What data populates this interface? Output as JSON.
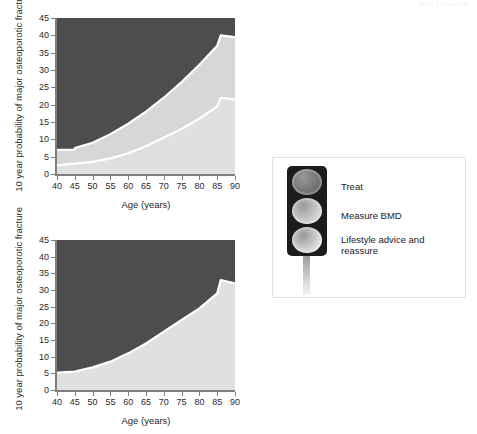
{
  "header": {
    "watermark": "BMJ | Practice"
  },
  "legend": {
    "panel_name": "traffic-light-legend",
    "items": [
      {
        "label": "Treat",
        "color": "#6b6b6b",
        "lamp": "red-lamp"
      },
      {
        "label": "Measure BMD",
        "color": "#d9d9d9",
        "lamp": "amber-lamp"
      },
      {
        "label": "Lifestyle advice and reassure",
        "color": "#e3e3e3",
        "lamp": "green-lamp"
      }
    ]
  },
  "colors": {
    "treat_zone": "#4d4d4d",
    "measure_zone": "#d7d7d7",
    "lifestyle_zone": "#e0e0e0",
    "boundary_line": "#ffffff",
    "axis": "#7d7d7d",
    "panel_border": "#e2e2e2"
  },
  "chart_data": [
    {
      "type": "area",
      "name": "chart-top",
      "title": "",
      "xlabel": "Age (years)",
      "ylabel": "10 year probability of major osteoporotic fracture",
      "xlim": [
        40,
        90
      ],
      "ylim": [
        0,
        45
      ],
      "xticks": [
        40,
        45,
        50,
        55,
        60,
        65,
        70,
        75,
        80,
        85,
        90
      ],
      "yticks": [
        0,
        5,
        10,
        15,
        20,
        25,
        30,
        35,
        40,
        45
      ],
      "grid": false,
      "legend_position": "external-right",
      "zones": [
        "Lifestyle advice and reassure",
        "Measure BMD",
        "Treat"
      ],
      "x": [
        40,
        45,
        45,
        50,
        55,
        60,
        65,
        70,
        75,
        80,
        85,
        86,
        90
      ],
      "series": [
        {
          "name": "upper boundary (Measure BMD / Treat)",
          "values": [
            7.0,
            7.0,
            7.5,
            9.0,
            11.5,
            14.5,
            18.0,
            22.0,
            26.5,
            31.5,
            37.0,
            40.0,
            39.5
          ]
        },
        {
          "name": "lower boundary (Lifestyle / Measure BMD)",
          "values": [
            2.5,
            2.5,
            3.0,
            3.5,
            4.5,
            6.0,
            8.0,
            10.5,
            13.0,
            16.0,
            19.5,
            22.0,
            21.5
          ]
        }
      ]
    },
    {
      "type": "area",
      "name": "chart-bottom",
      "title": "",
      "xlabel": "Age (years)",
      "ylabel": "10 year probability of major osteoporotic fracture",
      "xlim": [
        40,
        90
      ],
      "ylim": [
        0,
        45
      ],
      "xticks": [
        40,
        45,
        50,
        55,
        60,
        65,
        70,
        75,
        80,
        85,
        90
      ],
      "yticks": [
        0,
        5,
        10,
        15,
        20,
        25,
        30,
        35,
        40,
        45
      ],
      "grid": false,
      "legend_position": "external-right",
      "zones": [
        "Lifestyle advice and reassure",
        "Treat"
      ],
      "x": [
        40,
        45,
        50,
        55,
        60,
        65,
        70,
        75,
        80,
        85,
        86,
        90
      ],
      "series": [
        {
          "name": "boundary (Lifestyle / Treat)",
          "values": [
            5.2,
            5.5,
            6.8,
            8.5,
            11.0,
            14.0,
            17.5,
            21.0,
            24.5,
            29.0,
            33.0,
            32.0
          ]
        }
      ]
    }
  ]
}
